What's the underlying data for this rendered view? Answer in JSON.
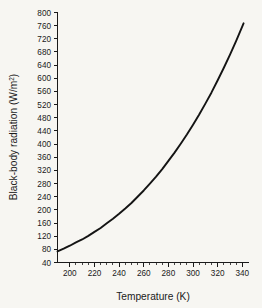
{
  "chart_data": {
    "type": "line",
    "title": "",
    "xlabel": "Temperature (K)",
    "ylabel": "Black-body radiation (W/m²)",
    "ylabel_base": "Black-body radiation (W/m",
    "ylabel_sup": "2",
    "ylabel_close": ")",
    "xlim": [
      190,
      345
    ],
    "ylim": [
      40,
      800
    ],
    "grid": false,
    "legend": null,
    "line_color": "#141414",
    "background_color": "#f7f6f2",
    "axis_color": "#1a1a1a",
    "x_major_ticks": [
      200,
      220,
      240,
      260,
      280,
      300,
      320,
      340
    ],
    "x_tick_labels": [
      "200",
      "220",
      "240",
      "260",
      "280",
      "300",
      "320",
      "340"
    ],
    "x_minor_interval": 5,
    "y_major_ticks": [
      40,
      80,
      120,
      160,
      200,
      240,
      280,
      320,
      360,
      400,
      440,
      480,
      520,
      560,
      600,
      640,
      680,
      720,
      760,
      800
    ],
    "y_tick_labels": [
      "40",
      "80",
      "120",
      "160",
      "200",
      "240",
      "280",
      "320",
      "360",
      "400",
      "440",
      "480",
      "520",
      "560",
      "600",
      "640",
      "680",
      "720",
      "760",
      "800"
    ],
    "x": [
      190,
      195,
      200,
      205,
      210,
      215,
      220,
      225,
      230,
      235,
      240,
      245,
      250,
      255,
      260,
      265,
      270,
      275,
      280,
      285,
      290,
      295,
      300,
      305,
      310,
      315,
      320,
      325,
      330,
      335,
      341
    ],
    "values": [
      74,
      82,
      91,
      101,
      110,
      121,
      133,
      145,
      159,
      173,
      188,
      204,
      221,
      240,
      259,
      280,
      301,
      324,
      349,
      374,
      401,
      429,
      459,
      490,
      523,
      557,
      594,
      632,
      672,
      714,
      767
    ]
  }
}
